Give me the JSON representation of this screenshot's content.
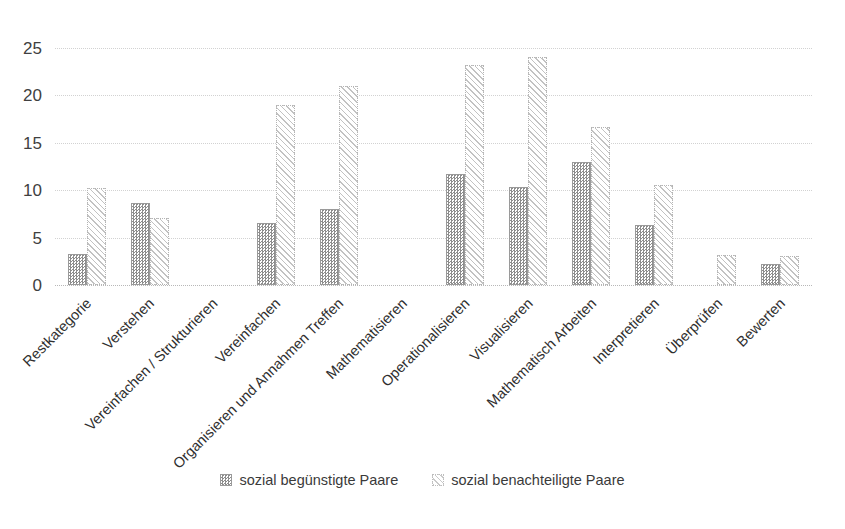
{
  "chart_data": {
    "type": "bar",
    "title": "",
    "subtitle": "",
    "xlabel": "",
    "ylabel": "",
    "ylim": [
      0,
      25
    ],
    "yticks": [
      0,
      5,
      10,
      15,
      20,
      25
    ],
    "grid": true,
    "legend_position": "bottom",
    "orientation": "vertical",
    "grouping": "grouped",
    "categories": [
      "Restkategorie",
      "Verstehen",
      "Vereinfachen / Strukturieren",
      "Vereinfachen",
      "Organisieren und Annahmen Treffen",
      "Mathematisieren",
      "Operationalisieren",
      "Visualisieren",
      "Mathematisch Arbeiten",
      "Interpretieren",
      "Überprüfen",
      "Bewerten"
    ],
    "series": [
      {
        "name": "sozial begünstigte Paare",
        "pattern": "checker-dotted",
        "values": [
          3.3,
          8.6,
          0,
          6.5,
          8.0,
          0,
          11.7,
          10.3,
          13.0,
          6.3,
          0,
          2.2
        ]
      },
      {
        "name": "sozial benachteiligte Paare",
        "pattern": "diagonal-hatch",
        "values": [
          10.2,
          7.1,
          0,
          19.0,
          21.0,
          0,
          23.2,
          24.0,
          16.7,
          10.5,
          3.2,
          3.1
        ]
      }
    ]
  },
  "legend": {
    "items": [
      {
        "label": "sozial begünstigte Paare"
      },
      {
        "label": "sozial benachteiligte Paare"
      }
    ]
  }
}
